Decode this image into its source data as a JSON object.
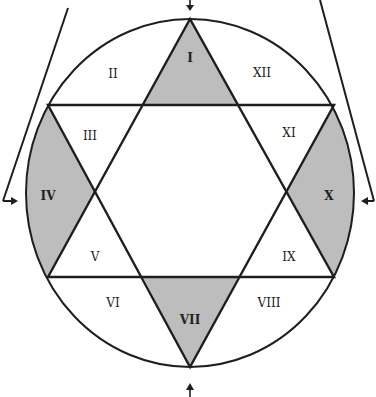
{
  "diagram": {
    "colors": {
      "stroke": "#1e1e1e",
      "shade": "#bdbdbd",
      "background": "#ffffff"
    },
    "houses": [
      {
        "id": "I",
        "label": "I",
        "shaded": true,
        "x": 190,
        "y": 58
      },
      {
        "id": "II",
        "label": "II",
        "shaded": false,
        "x": 113,
        "y": 74
      },
      {
        "id": "III",
        "label": "III",
        "shaded": false,
        "x": 90,
        "y": 136
      },
      {
        "id": "IV",
        "label": "IV",
        "shaded": true,
        "x": 48,
        "y": 196
      },
      {
        "id": "V",
        "label": "V",
        "shaded": false,
        "x": 95,
        "y": 257
      },
      {
        "id": "VI",
        "label": "VI",
        "shaded": false,
        "x": 113,
        "y": 303
      },
      {
        "id": "VII",
        "label": "VII",
        "shaded": true,
        "x": 190,
        "y": 320
      },
      {
        "id": "VIII",
        "label": "VIII",
        "shaded": false,
        "x": 269,
        "y": 303
      },
      {
        "id": "IX",
        "label": "IX",
        "shaded": false,
        "x": 289,
        "y": 257
      },
      {
        "id": "X",
        "label": "X",
        "shaded": true,
        "x": 329,
        "y": 196
      },
      {
        "id": "XI",
        "label": "XI",
        "shaded": false,
        "x": 289,
        "y": 133
      },
      {
        "id": "XII",
        "label": "XII",
        "shaded": false,
        "x": 262,
        "y": 73
      }
    ],
    "arrows": [
      {
        "name": "top-arrow",
        "direction": "down"
      },
      {
        "name": "bottom-arrow",
        "direction": "up"
      },
      {
        "name": "left-arrow",
        "direction": "right"
      },
      {
        "name": "right-arrow",
        "direction": "left"
      }
    ]
  }
}
